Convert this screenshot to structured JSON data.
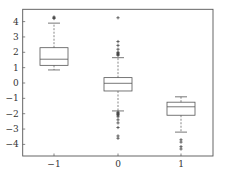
{
  "chart_data": {
    "type": "box",
    "title": "",
    "xlabel": "",
    "ylabel": "",
    "categories": [
      "-1",
      "0",
      "1"
    ],
    "x_tick_labels": [
      "−1",
      "0",
      "1"
    ],
    "y_ticks": [
      4,
      3,
      2,
      1,
      0,
      -1,
      -2,
      -3,
      -4
    ],
    "y_tick_labels": [
      "4",
      "3",
      "2",
      "1",
      "0",
      "−1",
      "−2",
      "−3",
      "−4"
    ],
    "ylim": [
      -4.7,
      4.8
    ],
    "grid": false,
    "legend": null,
    "boxes": [
      {
        "category": "-1",
        "whisker_low": 0.85,
        "q1": 1.15,
        "median": 1.55,
        "q3": 2.3,
        "whisker_high": 3.9,
        "outliers": [
          4.2,
          4.25,
          4.3
        ]
      },
      {
        "category": "0",
        "whisker_low": -1.82,
        "q1": -0.52,
        "median": -0.02,
        "q3": 0.35,
        "whisker_high": 1.65,
        "outliers": [
          1.8,
          1.85,
          1.9,
          1.95,
          2.0,
          2.2,
          2.45,
          2.7,
          4.25,
          -1.9,
          -1.95,
          -2.0,
          -2.05,
          -2.1,
          -2.2,
          -2.4,
          -2.6,
          -2.9,
          -3.45,
          -3.6
        ]
      },
      {
        "category": "1",
        "whisker_low": -3.2,
        "q1": -2.1,
        "median": -1.55,
        "q3": -1.25,
        "whisker_high": -0.9,
        "outliers": [
          -3.7,
          -3.85,
          -4.15,
          -4.3
        ]
      }
    ]
  },
  "layout": {
    "plot_left": 22.7,
    "plot_right": 213,
    "plot_top": 9.3,
    "plot_bottom": 156,
    "y_zero_px": 83,
    "px_per_unit": 15.35,
    "box_centers_px": [
      54,
      118,
      181
    ],
    "box_half_width": 14,
    "cap_half_width": 6
  },
  "colors": {
    "stroke": "#555555",
    "text": "#333333",
    "background": "#ffffff"
  }
}
